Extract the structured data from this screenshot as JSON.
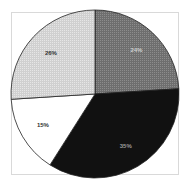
{
  "chart_data": {
    "type": "pie",
    "title": "",
    "categories": [
      "Slice A",
      "Slice B",
      "Slice C",
      "Slice D"
    ],
    "values": [
      24,
      35,
      15,
      26
    ],
    "labels": [
      "24%",
      "35%",
      "15%",
      "26%"
    ],
    "colors": [
      "#7a7a7a",
      "#111111",
      "#ffffff",
      "#d4d4d4"
    ],
    "label_colors": [
      "#cfcfcf",
      "#9a9a9a",
      "#333333",
      "#333333"
    ],
    "start_angle_deg": 0,
    "direction": "clockwise",
    "legend": "none"
  }
}
